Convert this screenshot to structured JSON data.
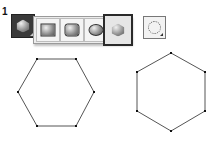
{
  "step_label": "1",
  "toolbar": {
    "active_tool": {
      "name": "polygon-tool",
      "icon": "hexagon"
    },
    "flyout_tools": [
      {
        "name": "rectangle-tool",
        "icon": "rectangle",
        "selected": false
      },
      {
        "name": "rounded-rectangle-tool",
        "icon": "rounded-rectangle",
        "selected": false
      },
      {
        "name": "ellipse-tool",
        "icon": "ellipse",
        "selected": false
      },
      {
        "name": "polygon-tool",
        "icon": "hexagon",
        "selected": true
      }
    ],
    "rotate_tool": {
      "name": "rotate-tool",
      "icon": "rotate-dotted-circle"
    }
  },
  "canvas": {
    "stroke_color": "#555555",
    "vertex_color": "#111111",
    "hexagons": [
      {
        "name": "flat-top-hexagon",
        "points": [
          [
            37,
            59
          ],
          [
            76,
            59
          ],
          [
            94,
            92
          ],
          [
            76,
            126
          ],
          [
            37,
            126
          ],
          [
            18,
            92
          ]
        ]
      },
      {
        "name": "pointy-top-hexagon",
        "points": [
          [
            171,
            53
          ],
          [
            205,
            72
          ],
          [
            205,
            111
          ],
          [
            171,
            131
          ],
          [
            137,
            111
          ],
          [
            137,
            72
          ]
        ]
      }
    ]
  }
}
